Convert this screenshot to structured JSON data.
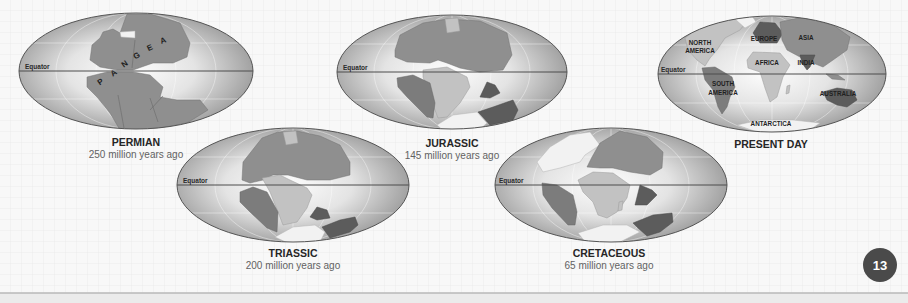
{
  "equator_label": "Equator",
  "page": {
    "number": "13"
  },
  "maps": [
    {
      "id": "permian",
      "title": "PERMIAN",
      "subtitle": "250 million years ago",
      "supercontinent_letters": [
        "P",
        "A",
        "N",
        "G",
        "E",
        "A"
      ]
    },
    {
      "id": "jurassic",
      "title": "JURASSIC",
      "subtitle": "145 million years ago"
    },
    {
      "id": "present-day",
      "title": "PRESENT DAY",
      "continent_labels": {
        "north_america": [
          "NORTH",
          "AMERICA"
        ],
        "south_america": [
          "SOUTH",
          "AMERICA"
        ],
        "europe": "EUROPE",
        "asia": "ASIA",
        "africa": "AFRICA",
        "india": "INDIA",
        "australia": "AUSTRALIA",
        "antarctica": "ANTARCTICA"
      }
    },
    {
      "id": "triassic",
      "title": "TRIASSIC",
      "subtitle": "200 million years ago"
    },
    {
      "id": "cretaceous",
      "title": "CRETACEOUS",
      "subtitle": "65 million years ago"
    }
  ],
  "colors": {
    "background": "#f7f7f7",
    "grid": "#e6e6e6",
    "land": "#8f8f8f",
    "land_dark": "#5c5c5c",
    "land_light": "#c2c2c2",
    "page_badge": "#4a4a4a"
  }
}
